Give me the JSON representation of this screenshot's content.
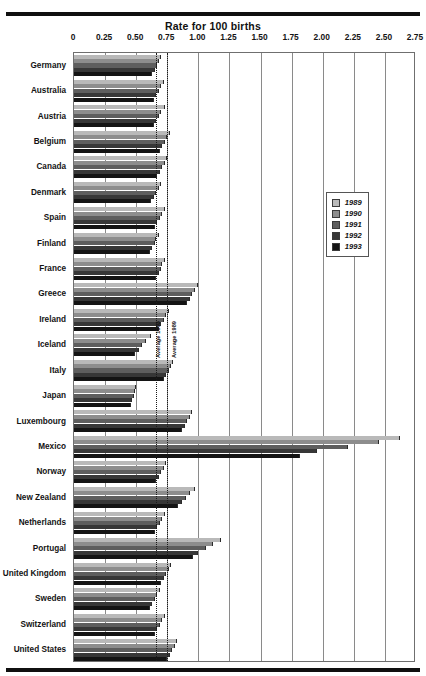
{
  "chart_data": {
    "type": "bar",
    "orientation": "horizontal",
    "title": "Rate for 100 births",
    "xlabel": "Rate for 100 births",
    "ylabel": "",
    "xlim": [
      0,
      2.75
    ],
    "grid": true,
    "legend_position": "right-middle",
    "tick_labels": [
      "0",
      "0.25",
      "0.50",
      "0.75",
      "1.00",
      "1.25",
      "1.50",
      "1.75",
      "2.00",
      "2.25",
      "2.50",
      "2.75"
    ],
    "tick_values": [
      0,
      0.25,
      0.5,
      0.75,
      1.0,
      1.25,
      1.5,
      1.75,
      2.0,
      2.25,
      2.5,
      2.75
    ],
    "categories": [
      "Germany",
      "Australia",
      "Austria",
      "Belgium",
      "Canada",
      "Denmark",
      "Spain",
      "Finland",
      "France",
      "Greece",
      "Ireland",
      "Iceland",
      "Italy",
      "Japan",
      "Luxembourg",
      "Mexico",
      "Norway",
      "New Zealand",
      "Netherlands",
      "Portugal",
      "United Kingdom",
      "Sweden",
      "Switzerland",
      "United States"
    ],
    "series": [
      {
        "name": "1989",
        "color": "#b9b9b9",
        "values": [
          0.7,
          0.72,
          0.73,
          0.77,
          0.75,
          0.7,
          0.73,
          0.68,
          0.73,
          1.0,
          0.76,
          0.62,
          0.8,
          0.5,
          0.95,
          2.62,
          0.74,
          0.97,
          0.73,
          1.18,
          0.78,
          0.69,
          0.73,
          0.83
        ]
      },
      {
        "name": "1990",
        "color": "#8d8d8d",
        "values": [
          0.68,
          0.7,
          0.7,
          0.75,
          0.73,
          0.68,
          0.71,
          0.66,
          0.71,
          0.97,
          0.74,
          0.58,
          0.78,
          0.49,
          0.93,
          2.45,
          0.72,
          0.93,
          0.71,
          1.12,
          0.76,
          0.67,
          0.71,
          0.81
        ]
      },
      {
        "name": "1991",
        "color": "#5e5e5e",
        "values": [
          0.67,
          0.68,
          0.68,
          0.73,
          0.71,
          0.66,
          0.69,
          0.65,
          0.7,
          0.95,
          0.72,
          0.55,
          0.76,
          0.48,
          0.91,
          2.2,
          0.7,
          0.9,
          0.69,
          1.06,
          0.74,
          0.65,
          0.69,
          0.79
        ]
      },
      {
        "name": "1992",
        "color": "#373737",
        "values": [
          0.65,
          0.66,
          0.66,
          0.71,
          0.69,
          0.64,
          0.67,
          0.63,
          0.68,
          0.93,
          0.7,
          0.52,
          0.74,
          0.47,
          0.89,
          1.95,
          0.68,
          0.87,
          0.67,
          1.0,
          0.72,
          0.63,
          0.67,
          0.77
        ]
      },
      {
        "name": "1993",
        "color": "#141414",
        "values": [
          0.63,
          0.64,
          0.64,
          0.69,
          0.67,
          0.62,
          0.65,
          0.61,
          0.66,
          0.91,
          0.68,
          0.49,
          0.72,
          0.46,
          0.87,
          1.82,
          0.66,
          0.84,
          0.65,
          0.96,
          0.7,
          0.61,
          0.65,
          0.75
        ]
      }
    ],
    "annotations": [
      {
        "label": "Average 1993",
        "value": 0.66
      },
      {
        "label": "Average 1989",
        "value": 0.75
      }
    ]
  },
  "legend": {
    "title": "",
    "entries": [
      {
        "label": "1989",
        "color": "#b9b9b9"
      },
      {
        "label": "1990",
        "color": "#8d8d8d"
      },
      {
        "label": "1991",
        "color": "#5e5e5e"
      },
      {
        "label": "1992",
        "color": "#373737"
      },
      {
        "label": "1993",
        "color": "#141414"
      }
    ]
  },
  "colors": {
    "axis": "#6f6f6f",
    "grid": "#8a8a8a",
    "rule": "#101010",
    "text": "#131313"
  }
}
